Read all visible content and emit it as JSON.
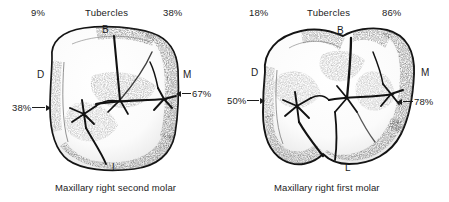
{
  "figure": {
    "background_color": "#ffffff",
    "ink_color": "#1c1c1c"
  },
  "panels": [
    {
      "id": "maxillary-right-second-molar",
      "header": "Tubercles",
      "caption": "Maxillary right second molar",
      "percent_top_left": "9%",
      "percent_top_right": "38%",
      "percent_left_arrow": "38%",
      "percent_right_arrow": "67%",
      "orientation": {
        "buccal": "B",
        "distal": "D",
        "mesial": "M",
        "lingual": "L"
      }
    },
    {
      "id": "maxillary-right-first-molar",
      "header": "Tubercles",
      "caption": "Maxillary right first molar",
      "percent_top_left": "18%",
      "percent_top_right": "86%",
      "percent_left_arrow": "50%",
      "percent_right_arrow": "78%",
      "orientation": {
        "buccal": "B",
        "distal": "D",
        "mesial": "M",
        "lingual": "L"
      }
    }
  ]
}
